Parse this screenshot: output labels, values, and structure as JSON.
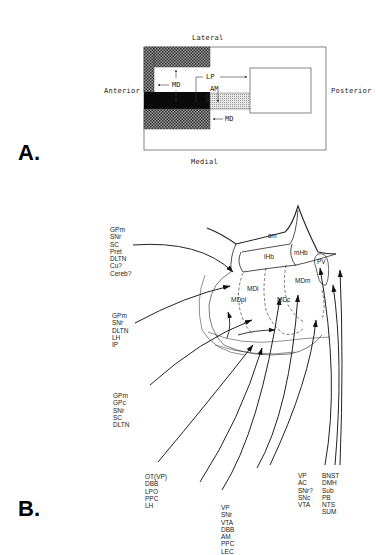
{
  "figure": {
    "panel_a": {
      "letter": "A.",
      "orientation": {
        "top": "Lateral",
        "bottom": "Medial",
        "left": "Anterior",
        "right": "Posterior"
      },
      "labels": {
        "md_upper": "MD",
        "lp": "LP",
        "am": "AM",
        "md_lower": "MD"
      }
    },
    "panel_b": {
      "letter": "B.",
      "regions": {
        "sm": "sm",
        "lhb": "lHb",
        "mhb": "mHb",
        "mdl": "MDl",
        "mdpl": "MDpl",
        "mdc": "MDc",
        "mdm": "MDm",
        "pv": "PV"
      },
      "source_groups": [
        {
          "id": "group1",
          "items": [
            "GPm",
            "SNr",
            "SC",
            "Pret",
            "DLTN",
            "Cu?",
            "Cereb?"
          ]
        },
        {
          "id": "group2",
          "items": [
            "GPm",
            "SNr",
            "DLTN",
            "LH",
            "IP"
          ]
        },
        {
          "id": "group3",
          "items": [
            "GPm",
            "GPc",
            "SNr",
            "SC",
            "DLTN"
          ]
        },
        {
          "id": "group4",
          "items": [
            "OT(VP)",
            "DBB",
            "LPO",
            "PPC",
            "LH"
          ]
        },
        {
          "id": "group5",
          "items": [
            "VP",
            "SNr",
            "VTA",
            "DBB",
            "AM",
            "PPC",
            "LEC"
          ]
        },
        {
          "id": "group6",
          "items": [
            "VP",
            "AC",
            "SNr?",
            "SNc",
            "VTA"
          ]
        },
        {
          "id": "group7",
          "items": [
            "BNST",
            "DMH",
            "Sub",
            "PB",
            "NTS",
            "SUM"
          ]
        }
      ]
    }
  }
}
